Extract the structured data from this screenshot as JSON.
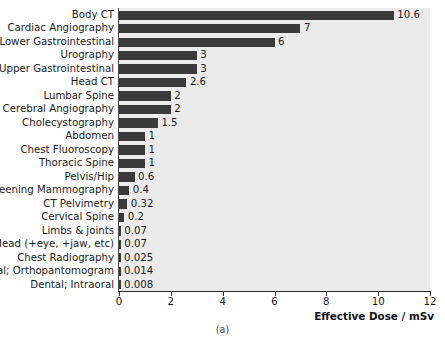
{
  "chart_data": {
    "type": "bar",
    "orientation": "horizontal",
    "title": "",
    "subtitle": "",
    "xlabel": "Effective Dose / mSv",
    "ylabel": "",
    "xlim": [
      0,
      12
    ],
    "xticks": [
      0,
      2,
      4,
      6,
      8,
      10,
      12
    ],
    "xticklabels": [
      "0",
      "2",
      "4",
      "6",
      "8",
      "10",
      "12"
    ],
    "grid": false,
    "legend": null,
    "caption": "(a)",
    "bar_color": "#3a3a3a",
    "panel_color": "#ebebeb",
    "categories": [
      "Body CT",
      "Cardiac Angiography",
      "Lower Gastrointestinal",
      "Urography",
      "Upper Gastrointestinal",
      "Head CT",
      "Lumbar Spine",
      "Cerebral Angiography",
      "Cholecystography",
      "Abdomen",
      "Chest Fluoroscopy",
      "Thoracic Spine",
      "Pelvis/Hip",
      "Screening Mammography",
      "CT Pelvimetry",
      "Cervical Spine",
      "Limbs & joints",
      "Head (+eye, +jaw, etc)",
      "Chest Radiography",
      "Dental; Orthopantomogram",
      "Dental; Intraoral"
    ],
    "values": [
      10.6,
      7,
      6,
      3,
      3,
      2.6,
      2,
      2,
      1.5,
      1,
      1,
      1,
      0.6,
      0.4,
      0.32,
      0.2,
      0.07,
      0.07,
      0.025,
      0.014,
      0.008
    ],
    "value_labels": [
      "10.6",
      "7",
      "6",
      "3",
      "3",
      "2.6",
      "2",
      "2",
      "1.5",
      "1",
      "1",
      "1",
      "0.6",
      "0.4",
      "0.32",
      "0.2",
      "0.07",
      "0.07",
      "0.025",
      "0.014",
      "0.008"
    ]
  }
}
